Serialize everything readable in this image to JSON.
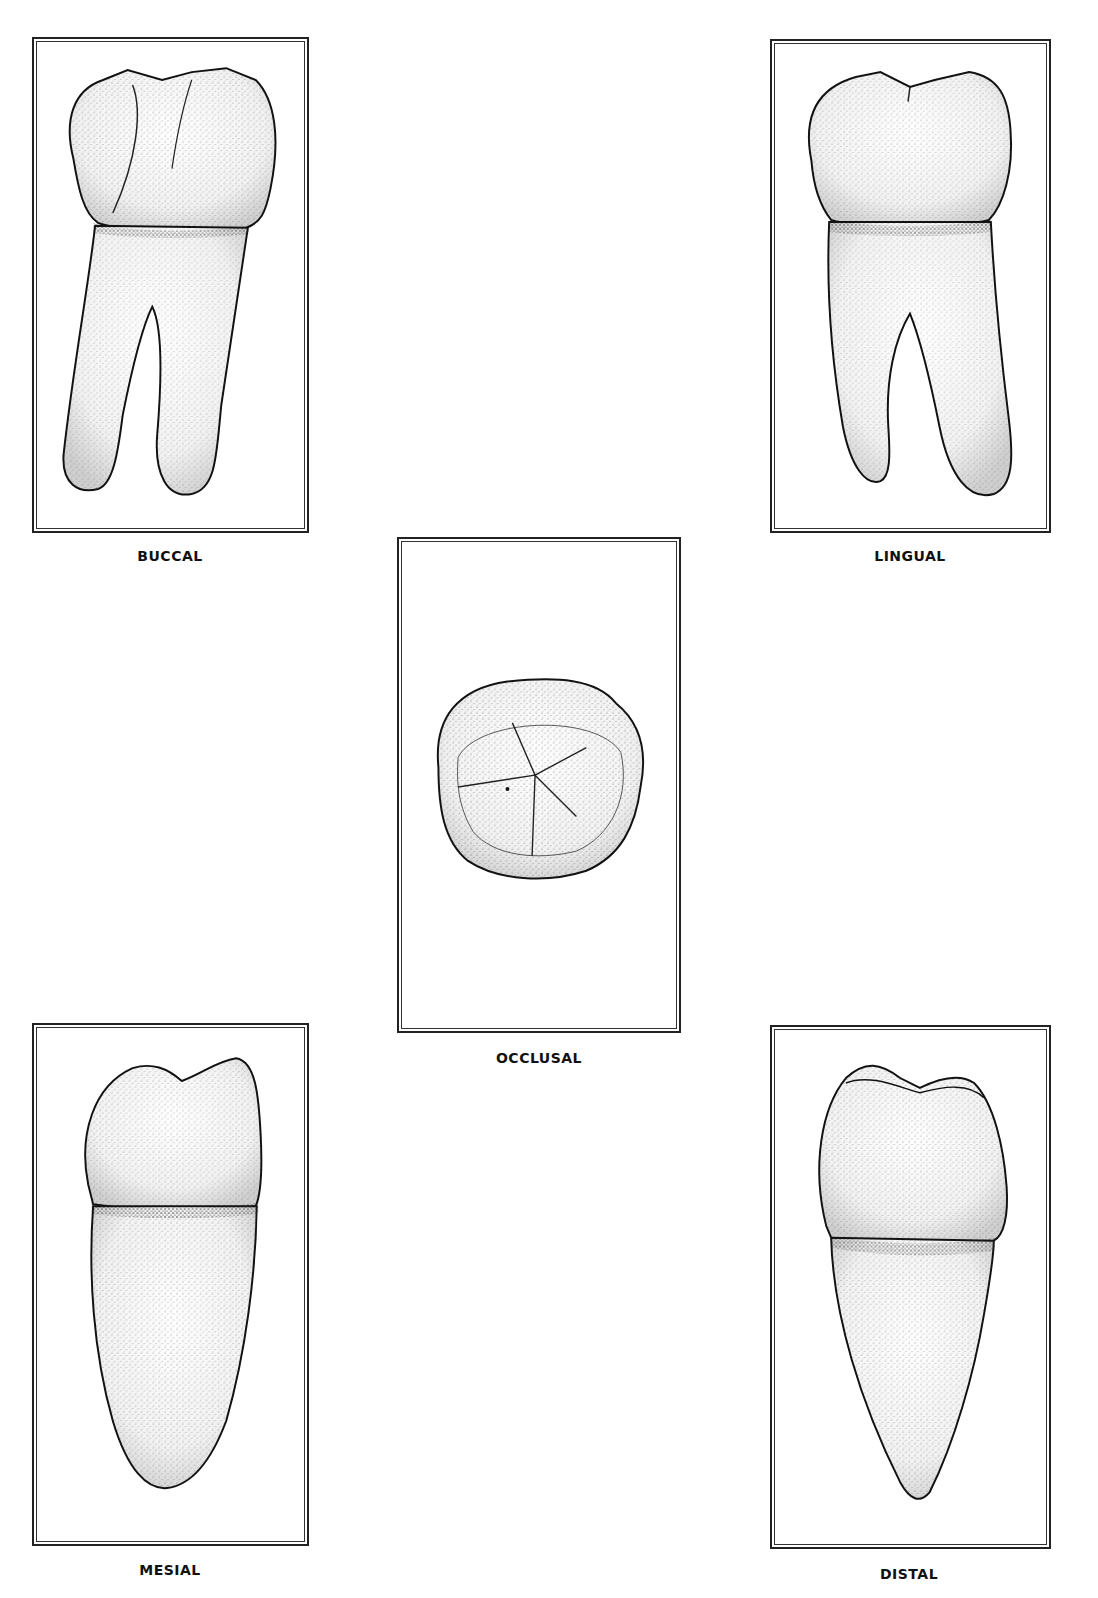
{
  "figure": {
    "views": [
      {
        "id": "buccal",
        "label": "BUCCAL"
      },
      {
        "id": "lingual",
        "label": "LINGUAL"
      },
      {
        "id": "occlusal",
        "label": "OCCLUSAL"
      },
      {
        "id": "mesial",
        "label": "MESIAL"
      },
      {
        "id": "distal",
        "label": "DISTAL"
      }
    ]
  }
}
